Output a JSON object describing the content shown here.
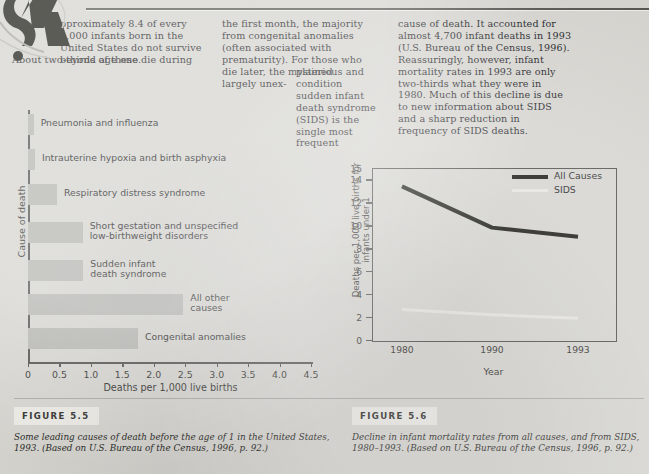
{
  "page": {
    "background_color": "#d3d2cd",
    "dropcap_letter": "A"
  },
  "body_text": {
    "col1_indented": "pproximately 8.4 of every 1,000 infants born in the United States do not survive beyond age one.",
    "col1_full": "About two-thirds of these die during",
    "col2": "the first month, the majority from congenital anomalies (often associated with prematurity). For those who die later, the mysterious and largely unex-",
    "col2_narrow": "plained condition sudden infant death syndrome (SIDS) is the single most frequent",
    "col3": "cause of death. It accounted for almost 4,700 infant deaths in 1993 (U.S. Bureau of the Census, 1996). Reassuringly, however, infant mortality rates in 1993 are only two-thirds what they were in 1980. Much of this decline is due to new information about SIDS and a sharp reduction in frequency of SIDS deaths."
  },
  "figure_5_5": {
    "tag": "FIGURE 5.5",
    "caption": "Some leading causes of death before the age of 1 in the United States, 1993. (Based on U.S. Bureau of the Census, 1996, p. 92.)"
  },
  "figure_5_6": {
    "tag": "FIGURE 5.6",
    "caption": "Decline in infant mortality rates from all causes, and from SIDS, 1980–1993. (Based on U.S. Bureau of the Census, 1996, p. 92.)"
  },
  "chart_data": [
    {
      "type": "bar",
      "orientation": "horizontal",
      "title": "",
      "xlabel": "Deaths per 1,000 live births",
      "ylabel": "Cause of death",
      "xlim": [
        0,
        4.5
      ],
      "xticks": [
        "0",
        "0.5",
        "1.0",
        "1.5",
        "2.0",
        "2.5",
        "3.0",
        "3.5",
        "4.0",
        "4.5"
      ],
      "xtick_values": [
        0,
        0.5,
        1.0,
        1.5,
        2.0,
        2.5,
        3.0,
        3.5,
        4.0,
        4.5
      ],
      "grid": false,
      "bar_color": "#b2b2ae",
      "categories": [
        "Pneumonia and influenza",
        "Intrauterine hypoxia and birth asphyxia",
        "Respiratory distress syndrome",
        "Short gestation and unspecified\nlow-birthweight disorders",
        "Sudden infant\ndeath syndrome",
        "All other\ncauses",
        "Congenital anomalies"
      ],
      "values": [
        0.09,
        0.11,
        0.46,
        0.87,
        0.88,
        2.47,
        1.75
      ]
    },
    {
      "type": "line",
      "title": "",
      "xlabel": "Year",
      "ylabel": "Deaths per 1,000 live births for infants under 1",
      "x": [
        "1980",
        "1990",
        "1993"
      ],
      "ylim": [
        0,
        15
      ],
      "yticks": [
        "0",
        "2",
        "4",
        "6",
        "8",
        "10",
        "12",
        "14",
        "15"
      ],
      "ytick_values": [
        0,
        2,
        4,
        6,
        8,
        10,
        12,
        14,
        15
      ],
      "grid": false,
      "legend_position": "top-right",
      "series": [
        {
          "name": "All Causes",
          "values": [
            13.4,
            9.8,
            9.0
          ],
          "color": "#14140f"
        },
        {
          "name": "SIDS",
          "values": [
            2.65,
            2.2,
            1.9
          ],
          "color": "#e4e3de"
        }
      ]
    }
  ]
}
